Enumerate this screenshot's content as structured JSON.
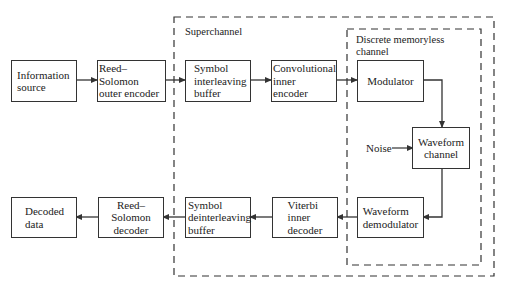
{
  "diagram": {
    "type": "block-diagram",
    "regions": {
      "superchannel": {
        "label": "Superchannel"
      },
      "dmc": {
        "label": "Discrete memoryless\nchannel"
      }
    },
    "blocks": {
      "info_source": "Information\nsource",
      "rs_encoder": "Reed–Solomon\nouter encoder",
      "interleaver": "Symbol\ninterleaving\nbuffer",
      "conv_encoder": "Convolutional\ninner\nencoder",
      "modulator": "Modulator",
      "waveform_channel": "Waveform\nchannel",
      "demodulator": "Waveform\ndemodulator",
      "viterbi": "Viterbi\ninner\ndecoder",
      "deinterleaver": "Symbol\ndeinterleaving\nbuffer",
      "rs_decoder": "Reed–\nSolomon\ndecoder",
      "decoded_data": "Decoded\ndata"
    },
    "inputs": {
      "noise": "Noise"
    },
    "edges": [
      [
        "Information source",
        "Reed–Solomon outer encoder"
      ],
      [
        "Reed–Solomon outer encoder",
        "Symbol interleaving buffer"
      ],
      [
        "Symbol interleaving buffer",
        "Convolutional inner encoder"
      ],
      [
        "Convolutional inner encoder",
        "Modulator"
      ],
      [
        "Modulator",
        "Waveform channel"
      ],
      [
        "Noise",
        "Waveform channel"
      ],
      [
        "Waveform channel",
        "Waveform demodulator"
      ],
      [
        "Waveform demodulator",
        "Viterbi inner decoder"
      ],
      [
        "Viterbi inner decoder",
        "Symbol deinterleaving buffer"
      ],
      [
        "Symbol deinterleaving buffer",
        "Reed–Solomon decoder"
      ],
      [
        "Reed–Solomon decoder",
        "Decoded data"
      ]
    ],
    "colors": {
      "line": "#333333",
      "background": "#ffffff"
    }
  }
}
